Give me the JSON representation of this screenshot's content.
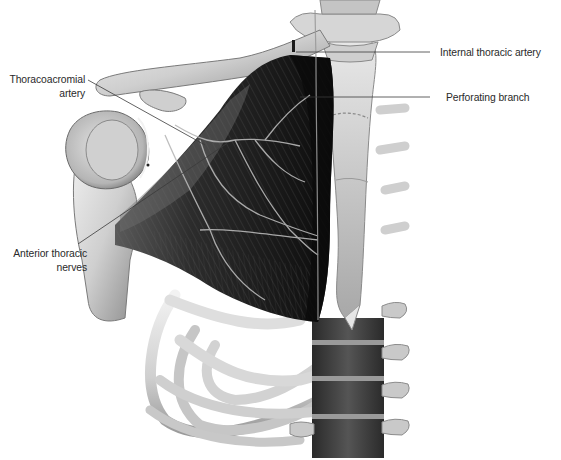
{
  "figure": {
    "style": "grayscale anatomical illustration"
  },
  "labels": {
    "thoracoacromial_artery": {
      "line1": "Thoracoacromial",
      "line2": "artery"
    },
    "anterior_thoracic_nerves": {
      "line1": "Anterior thoracic",
      "line2": "nerves"
    },
    "internal_thoracic_artery": {
      "text": "Internal thoracic artery"
    },
    "perforating_branch": {
      "text": "Perforating branch"
    }
  },
  "colors": {
    "bone": "#d9d9d9",
    "bone_shadow": "#8a8a8a",
    "muscle_dark": "#1c1c1c",
    "muscle_mid": "#3a3a3a",
    "vessel": "#b5b5b5",
    "leader_line": "#3a3a3a",
    "label_text": "#2a2a2a"
  }
}
